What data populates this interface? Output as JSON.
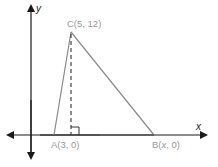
{
  "diagram": {
    "axes": {
      "x_label": "x",
      "y_label": "y"
    },
    "points": {
      "A": {
        "label": "A(3, 0)"
      },
      "B": {
        "label_prefix": "B(",
        "label_var": "x",
        "label_suffix": ", 0)"
      },
      "C": {
        "label": "C(5, 12)"
      }
    },
    "colors": {
      "axis": "#1a1a1a",
      "triangle": "#8a8a8a",
      "label": "#9a9a9a"
    }
  }
}
